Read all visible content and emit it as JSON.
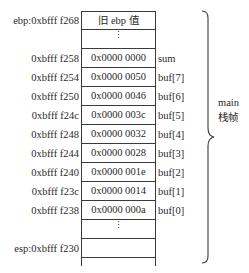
{
  "diagram": {
    "rows": [
      {
        "address": "ebp:0xbfff f268",
        "value": "旧 ebp 值",
        "variable": ""
      },
      {
        "address": "",
        "value": "⋮",
        "variable": ""
      },
      {
        "address": "0xbfff f258",
        "value": "0x0000 0000",
        "variable": "sum"
      },
      {
        "address": "0xbfff f254",
        "value": "0x0000 0050",
        "variable": "buf[7]"
      },
      {
        "address": "0xbfff f250",
        "value": "0x0000 0046",
        "variable": "buf[6]"
      },
      {
        "address": "0xbfff f24c",
        "value": "0x0000 003c",
        "variable": "buf[5]"
      },
      {
        "address": "0xbfff f248",
        "value": "0x0000 0032",
        "variable": "buf[4]"
      },
      {
        "address": "0xbfff f244",
        "value": "0x0000 0028",
        "variable": "buf[3]"
      },
      {
        "address": "0xbfff f240",
        "value": "0x0000 001e",
        "variable": "buf[2]"
      },
      {
        "address": "0xbfff f23c",
        "value": "0x0000 0014",
        "variable": "buf[1]"
      },
      {
        "address": "0xbfff f238",
        "value": "0x0000 000a",
        "variable": "buf[0]"
      },
      {
        "address": "",
        "value": "⋮",
        "variable": ""
      },
      {
        "address": "esp:0xbfff f230",
        "value": "",
        "variable": ""
      }
    ],
    "frame_label_line1": "main",
    "frame_label_line2": "栈帧"
  }
}
